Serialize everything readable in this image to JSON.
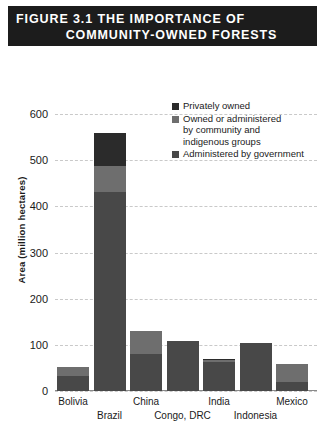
{
  "figure": {
    "title_line1": "FIGURE 3.1 THE IMPORTANCE OF",
    "title_line2": "COMMUNITY-OWNED FORESTS"
  },
  "colors": {
    "private": "#2b2b2b",
    "community": "#6e6e6e",
    "government": "#484848",
    "banner_bg": "#1c1c1c",
    "banner_text": "#ffffff",
    "gridline": "#c9c9c9"
  },
  "legend": {
    "items": [
      {
        "label": "Privately owned",
        "color": "#2b2b2b"
      },
      {
        "label": "Owned or administered\nby community and\nindigenous groups",
        "color": "#6e6e6e"
      },
      {
        "label": "Administered by government",
        "color": "#484848"
      }
    ]
  },
  "chart_data": {
    "type": "bar",
    "title": "FIGURE 3.1 THE IMPORTANCE OF COMMUNITY-OWNED FORESTS",
    "xlabel": "",
    "ylabel": "Area (million hectares)",
    "ylim": [
      0,
      600
    ],
    "yticks": [
      0,
      100,
      200,
      300,
      400,
      500,
      600
    ],
    "grid": true,
    "legend_position": "inside-top-right",
    "stacked": true,
    "categories": [
      "Bolivia",
      "Brazil",
      "China",
      "Congo, DRC",
      "India",
      "Indonesia",
      "Mexico"
    ],
    "categories_display": [
      "Bolivia",
      "Brazil",
      "China",
      "Congo, DRC",
      "India",
      "Indonesia",
      "Mexico"
    ],
    "series": [
      {
        "name": "Administered by government",
        "values": [
          33,
          430,
          80,
          108,
          62,
          104,
          20
        ]
      },
      {
        "name": "Owned or administered by community and indigenous groups",
        "values": [
          19,
          58,
          50,
          0,
          6,
          0,
          38
        ]
      },
      {
        "name": "Privately owned",
        "values": [
          0,
          70,
          0,
          0,
          2,
          0,
          0
        ]
      }
    ],
    "totals": [
      52,
      558,
      130,
      108,
      70,
      104,
      58
    ]
  },
  "axis": {
    "ytick_labels": [
      "600",
      "500",
      "400",
      "300",
      "200",
      "100",
      "0"
    ]
  }
}
